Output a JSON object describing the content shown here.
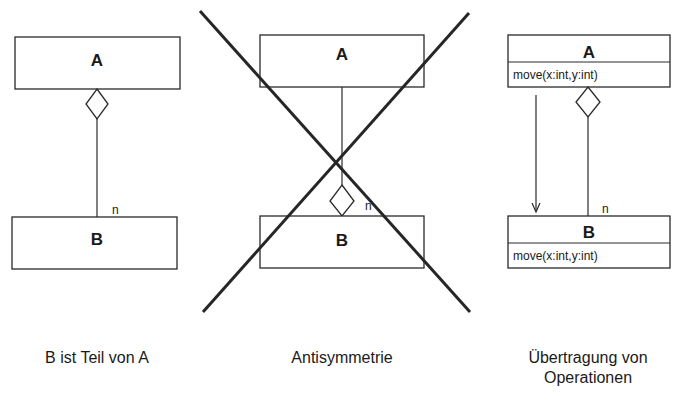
{
  "diagrams": [
    {
      "caption": "B ist Teil von A",
      "class_a": "A",
      "class_b": "B",
      "multiplicity": "n"
    },
    {
      "caption": "Antisymmetrie",
      "class_a": "A",
      "class_b": "B",
      "multiplicity": "n",
      "crossed_out": true
    },
    {
      "caption_line1": "Übertragung von",
      "caption_line2": "Operationen",
      "class_a": "A",
      "class_a_operation": "move(x:int,y:int)",
      "class_b": "B",
      "class_b_operation": "move(x:int,y:int)",
      "multiplicity": "n"
    }
  ]
}
